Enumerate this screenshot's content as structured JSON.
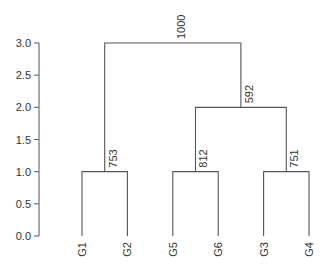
{
  "chart_data": {
    "type": "dendrogram",
    "title": "",
    "xlabel": "",
    "ylabel": "",
    "ylim": [
      0,
      3
    ],
    "yticks": [
      0.0,
      0.5,
      1.0,
      1.5,
      2.0,
      2.5,
      3.0
    ],
    "ytick_labels": [
      "0.0",
      "0.5",
      "1.0",
      "1.5",
      "2.0",
      "2.5",
      "3.0"
    ],
    "leaves": [
      "G1",
      "G2",
      "G5",
      "G6",
      "G3",
      "G4"
    ],
    "merges": [
      {
        "id": "n1",
        "left": "G1",
        "right": "G2",
        "height": 1.0,
        "label": "753"
      },
      {
        "id": "n2",
        "left": "G5",
        "right": "G6",
        "height": 1.0,
        "label": "812"
      },
      {
        "id": "n3",
        "left": "G3",
        "right": "G4",
        "height": 1.0,
        "label": "751"
      },
      {
        "id": "n4",
        "left": "n2",
        "right": "n3",
        "height": 2.0,
        "label": "592"
      },
      {
        "id": "n5",
        "left": "n1",
        "right": "n4",
        "height": 3.0,
        "label": "1000"
      }
    ],
    "grid": false,
    "legend": "none"
  }
}
